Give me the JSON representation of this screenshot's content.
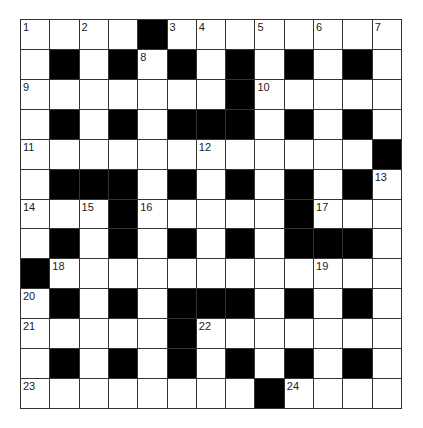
{
  "puzzle": {
    "type": "crossword",
    "rows": 13,
    "cols": 13,
    "colors": {
      "block": "#000000",
      "cell": "#ffffff",
      "line": "#333333"
    },
    "layout": [
      "....#........",
      ".#.#.#.#.#.#.",
      ".......#.....",
      ".#.#.###.#.#.",
      "............#",
      ".###.#.#.#.#.",
      "...#.....#...",
      ".#.#.#.#.###.",
      "#............",
      ".#.#.###.#.#.",
      ".....#.......",
      ".#.#.#.#.#.#.",
      "........#...."
    ],
    "numbers": [
      {
        "r": 0,
        "c": 0,
        "n": "1"
      },
      {
        "r": 0,
        "c": 2,
        "n": "2"
      },
      {
        "r": 0,
        "c": 5,
        "n": "3"
      },
      {
        "r": 0,
        "c": 6,
        "n": "4"
      },
      {
        "r": 0,
        "c": 8,
        "n": "5"
      },
      {
        "r": 0,
        "c": 10,
        "n": "6"
      },
      {
        "r": 0,
        "c": 12,
        "n": "7"
      },
      {
        "r": 1,
        "c": 4,
        "n": "8"
      },
      {
        "r": 2,
        "c": 0,
        "n": "9"
      },
      {
        "r": 2,
        "c": 8,
        "n": "10"
      },
      {
        "r": 4,
        "c": 0,
        "n": "11"
      },
      {
        "r": 4,
        "c": 6,
        "n": "12"
      },
      {
        "r": 5,
        "c": 12,
        "n": "13"
      },
      {
        "r": 6,
        "c": 0,
        "n": "14"
      },
      {
        "r": 6,
        "c": 2,
        "n": "15"
      },
      {
        "r": 6,
        "c": 4,
        "n": "16"
      },
      {
        "r": 6,
        "c": 10,
        "n": "17"
      },
      {
        "r": 8,
        "c": 1,
        "n": "18"
      },
      {
        "r": 8,
        "c": 10,
        "n": "19"
      },
      {
        "r": 9,
        "c": 0,
        "n": "20"
      },
      {
        "r": 10,
        "c": 0,
        "n": "21"
      },
      {
        "r": 10,
        "c": 6,
        "n": "22"
      },
      {
        "r": 12,
        "c": 0,
        "n": "23"
      },
      {
        "r": 12,
        "c": 9,
        "n": "24"
      }
    ]
  }
}
